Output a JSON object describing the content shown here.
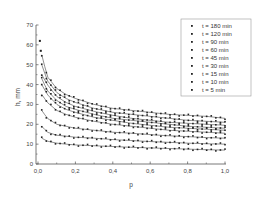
{
  "chart_data": {
    "type": "scatter",
    "title": "",
    "xlabel": "p",
    "ylabel": "h, mm",
    "xlim": [
      0.0,
      1.0
    ],
    "ylim": [
      0,
      70
    ],
    "xticks": [
      "0,0",
      "0,2",
      "0,4",
      "0,6",
      "0,8",
      "1,0"
    ],
    "yticks": [
      "0",
      "10",
      "20",
      "30",
      "40",
      "50",
      "60",
      "70"
    ],
    "grid": false,
    "legend_position": "upper right",
    "x": [
      0.02,
      0.05,
      0.1,
      0.15,
      0.2,
      0.3,
      0.4,
      0.5,
      0.6,
      0.7,
      0.8,
      0.9,
      1.0
    ],
    "series": [
      {
        "name": "t = 180 min",
        "values": [
          55,
          44,
          38,
          35,
          33,
          30,
          28,
          27,
          26,
          25,
          24.5,
          24,
          23
        ]
      },
      {
        "name": "t = 120 min",
        "values": [
          50,
          42,
          36,
          33,
          31,
          28,
          26,
          25,
          24,
          23,
          22,
          21.5,
          21
        ]
      },
      {
        "name": "t = 90 min",
        "values": [
          45,
          40,
          34,
          31,
          29,
          26.5,
          24.5,
          23,
          22,
          21,
          20.5,
          20,
          19.5
        ]
      },
      {
        "name": "t = 60 min",
        "values": [
          43,
          37,
          32,
          29,
          27.5,
          25,
          23,
          22,
          21,
          20,
          19,
          18.5,
          18
        ]
      },
      {
        "name": "t = 45 min",
        "values": [
          40,
          35,
          30,
          27.5,
          26,
          23.5,
          22,
          20.5,
          19.5,
          18.5,
          18,
          17.5,
          17
        ]
      },
      {
        "name": "t = 30 min",
        "values": [
          35,
          31,
          27,
          25,
          23.5,
          21.5,
          20,
          19,
          18,
          17,
          16.5,
          16,
          15.5
        ]
      },
      {
        "name": "t = 15 min",
        "values": [
          27,
          23,
          20,
          19,
          18,
          17,
          16,
          15.5,
          14.8,
          14.2,
          13.8,
          13.3,
          13
        ]
      },
      {
        "name": "t = 10 min",
        "values": [
          19,
          16,
          14.5,
          14,
          13.5,
          13,
          12.3,
          11.8,
          11.3,
          10.9,
          10.5,
          10.2,
          10
        ]
      },
      {
        "name": "t = 5 min",
        "values": [
          13,
          11.5,
          10.5,
          10,
          9.6,
          9.2,
          8.8,
          8.4,
          8.1,
          7.8,
          7.5,
          7.2,
          7
        ]
      }
    ],
    "outliers": [
      {
        "series": "t = 180 min",
        "x": 0.01,
        "y": 62
      },
      {
        "series": "t = 180 min",
        "x": 0.015,
        "y": 57
      }
    ]
  },
  "legend": {
    "items": [
      {
        "label": "t = 180 min",
        "marker": "square"
      },
      {
        "label": "t = 120 min",
        "marker": "circle"
      },
      {
        "label": "t = 90 min",
        "marker": "triangle-up"
      },
      {
        "label": "t = 60 min",
        "marker": "triangle-down"
      },
      {
        "label": "t = 45 min",
        "marker": "diamond"
      },
      {
        "label": "t = 30 min",
        "marker": "triangle-left"
      },
      {
        "label": "t = 15 min",
        "marker": "triangle-right"
      },
      {
        "label": "t = 10 min",
        "marker": "hexagon"
      },
      {
        "label": "t = 5 min",
        "marker": "star"
      }
    ]
  },
  "colors": {
    "data": "#222222",
    "axis": "#555555",
    "legend_border": "#999999"
  }
}
